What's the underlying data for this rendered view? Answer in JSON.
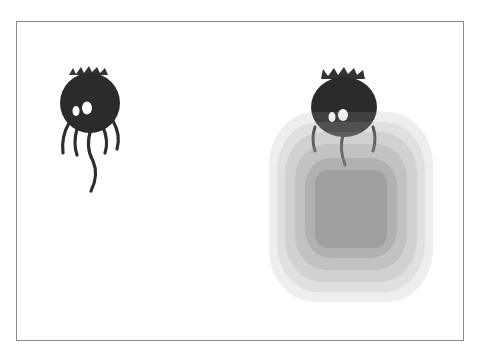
{
  "scene": {
    "title": "",
    "caption": "",
    "colors": {
      "frame_border": "#8a8a8a",
      "creature_body": "#2b2b2b",
      "glow": "#9a9a9a"
    }
  },
  "entities": [
    {
      "name": "dark-creature",
      "state": "idle"
    },
    {
      "name": "dark-creature",
      "state": "with-glow-effect"
    }
  ]
}
